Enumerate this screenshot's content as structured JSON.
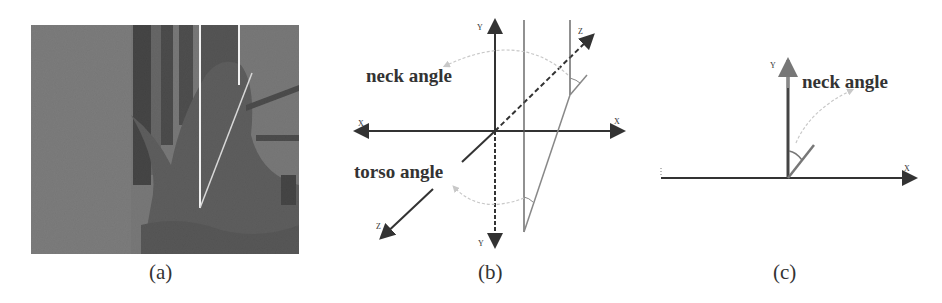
{
  "figure": {
    "panels": [
      {
        "id": "a",
        "caption": "(a)",
        "content": "grayscale photo of seated person with white reference lines overlaid"
      },
      {
        "id": "b",
        "caption": "(b)",
        "labels": {
          "neck": "neck angle",
          "torso": "torso angle"
        },
        "axes": {
          "x_pos": "X",
          "x_neg": "X",
          "y_pos": "Y",
          "y_neg": "Y",
          "z_pos": "Z",
          "z_neg": "Z"
        }
      },
      {
        "id": "c",
        "caption": "(c)",
        "labels": {
          "neck": "neck angle"
        },
        "axes": {
          "x": "X",
          "y": "Y"
        }
      }
    ]
  },
  "colors": {
    "axis": "#333333",
    "reference_line": "#888888",
    "arc": "#c8c8c8",
    "photo_bg": "#6f6f6f"
  }
}
